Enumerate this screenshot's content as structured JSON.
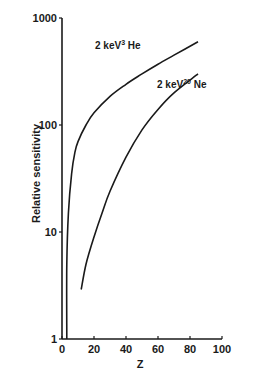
{
  "chart_data": {
    "type": "line",
    "title": "",
    "xlabel": "Z",
    "ylabel": "Relative sensitivity",
    "xlim": [
      0,
      100
    ],
    "ylim": [
      1,
      1000
    ],
    "yscale": "log",
    "grid": false,
    "legend": "inline annotations",
    "x_ticks": [
      "0",
      "20",
      "40",
      "60",
      "80",
      "100"
    ],
    "y_ticks": [
      "1",
      "10",
      "100",
      "1000"
    ],
    "series": [
      {
        "name": "2 keV 3He",
        "label_main": "2 keV",
        "label_sup": "3",
        "label_el": "He",
        "x": [
          3,
          3,
          4,
          6,
          8,
          10,
          15,
          20,
          30,
          40,
          50,
          60,
          70,
          85
        ],
        "y": [
          1,
          5,
          15,
          35,
          55,
          70,
          100,
          130,
          185,
          240,
          300,
          370,
          450,
          600
        ]
      },
      {
        "name": "2 keV 20Ne",
        "label_main": "2 keV",
        "label_sup": "20",
        "label_el": "Ne",
        "x": [
          12,
          15,
          20,
          25,
          30,
          40,
          50,
          60,
          70,
          85
        ],
        "y": [
          2.9,
          5,
          9,
          15,
          24,
          50,
          90,
          140,
          200,
          300
        ]
      }
    ],
    "annotations": [
      {
        "text": "2 keV3 He",
        "near_series": "2 keV 3He"
      },
      {
        "text": "2 keV20 Ne",
        "near_series": "2 keV 20Ne"
      }
    ]
  }
}
